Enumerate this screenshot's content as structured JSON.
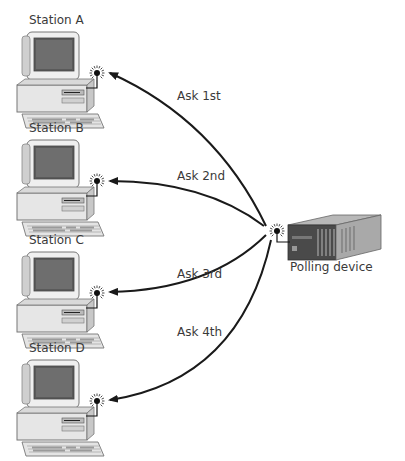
{
  "diagram": {
    "type": "polling-network",
    "stations": [
      {
        "id": "A",
        "label": "Station A",
        "query": "Ask 1st"
      },
      {
        "id": "B",
        "label": "Station B",
        "query": "Ask 2nd"
      },
      {
        "id": "C",
        "label": "Station C",
        "query": "Ask 3rd"
      },
      {
        "id": "D",
        "label": "Station D",
        "query": "Ask 4th"
      }
    ],
    "polling_device": {
      "label": "Polling device"
    },
    "colors": {
      "line": "#1a1a1a",
      "text": "#3a3a3a",
      "device_dark": "#4a4a4a",
      "device_mid": "#8a8a8a",
      "device_light": "#c8c8c8",
      "computer_body": "#e8e8e8",
      "screen": "#555555"
    }
  }
}
